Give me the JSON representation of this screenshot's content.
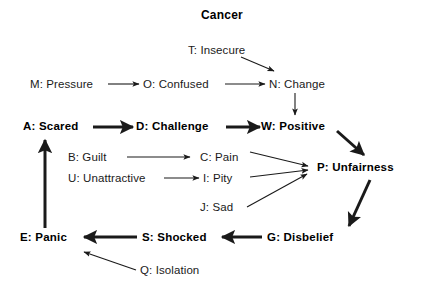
{
  "diagram": {
    "title": "Cancer",
    "title_x": 201,
    "title_y": 8,
    "width": 423,
    "height": 298,
    "stroke_color": "#1a1a1a",
    "text_color": "#1a1a1a",
    "background_color": "#ffffff"
  },
  "nodes": [
    {
      "id": "T",
      "label": "T: Insecure",
      "x": 188,
      "y": 44,
      "bold": false
    },
    {
      "id": "M",
      "label": "M: Pressure",
      "x": 30,
      "y": 78,
      "bold": false
    },
    {
      "id": "O",
      "label": "O: Confused",
      "x": 143,
      "y": 78,
      "bold": false
    },
    {
      "id": "N",
      "label": "N: Change",
      "x": 269,
      "y": 78,
      "bold": false
    },
    {
      "id": "A",
      "label": "A: Scared",
      "x": 23,
      "y": 120,
      "bold": true
    },
    {
      "id": "D",
      "label": "D: Challenge",
      "x": 136,
      "y": 120,
      "bold": true
    },
    {
      "id": "W",
      "label": "W: Positive",
      "x": 261,
      "y": 120,
      "bold": true
    },
    {
      "id": "B",
      "label": "B: Guilt",
      "x": 68,
      "y": 151,
      "bold": false
    },
    {
      "id": "C",
      "label": "C: Pain",
      "x": 200,
      "y": 151,
      "bold": false
    },
    {
      "id": "P",
      "label": "P: Unfairness",
      "x": 317,
      "y": 161,
      "bold": true
    },
    {
      "id": "U",
      "label": "U: Unattractive",
      "x": 68,
      "y": 172,
      "bold": false
    },
    {
      "id": "I",
      "label": "I: Pity",
      "x": 203,
      "y": 172,
      "bold": false
    },
    {
      "id": "J",
      "label": "J: Sad",
      "x": 200,
      "y": 201,
      "bold": false
    },
    {
      "id": "E",
      "label": "E: Panic",
      "x": 20,
      "y": 231,
      "bold": true
    },
    {
      "id": "S",
      "label": "S: Shocked",
      "x": 142,
      "y": 231,
      "bold": true
    },
    {
      "id": "G",
      "label": "G: Disbelief",
      "x": 267,
      "y": 231,
      "bold": true
    },
    {
      "id": "Q",
      "label": "Q: Isolation",
      "x": 140,
      "y": 264,
      "bold": false
    }
  ],
  "edges": [
    {
      "id": "M-O",
      "from": "M",
      "to": "O",
      "weight": "thin",
      "x1": 108,
      "y1": 84,
      "x2": 139,
      "y2": 84
    },
    {
      "id": "O-N",
      "from": "O",
      "to": "N",
      "weight": "thin",
      "x1": 225,
      "y1": 84,
      "x2": 265,
      "y2": 84
    },
    {
      "id": "T-N",
      "from": "T",
      "to": "N",
      "weight": "thin",
      "x1": 241,
      "y1": 57,
      "x2": 274,
      "y2": 71
    },
    {
      "id": "N-W",
      "from": "N",
      "to": "W",
      "weight": "thin",
      "x1": 295,
      "y1": 93,
      "x2": 295,
      "y2": 115
    },
    {
      "id": "A-D",
      "from": "A",
      "to": "D",
      "weight": "thick",
      "x1": 93,
      "y1": 127,
      "x2": 133,
      "y2": 127
    },
    {
      "id": "D-W",
      "from": "D",
      "to": "W",
      "weight": "thick",
      "x1": 226,
      "y1": 127,
      "x2": 260,
      "y2": 127
    },
    {
      "id": "W-P",
      "from": "W",
      "to": "P",
      "weight": "thick",
      "x1": 337,
      "y1": 131,
      "x2": 364,
      "y2": 155
    },
    {
      "id": "B-C",
      "from": "B",
      "to": "C",
      "weight": "thin",
      "x1": 127,
      "y1": 157,
      "x2": 190,
      "y2": 157
    },
    {
      "id": "U-I",
      "from": "U",
      "to": "I",
      "weight": "thin",
      "x1": 164,
      "y1": 178,
      "x2": 199,
      "y2": 178
    },
    {
      "id": "C-P",
      "from": "C",
      "to": "P",
      "weight": "thin",
      "x1": 250,
      "y1": 152,
      "x2": 308,
      "y2": 166
    },
    {
      "id": "I-P",
      "from": "I",
      "to": "P",
      "weight": "thin",
      "x1": 250,
      "y1": 177,
      "x2": 308,
      "y2": 170
    },
    {
      "id": "J-P",
      "from": "J",
      "to": "P",
      "weight": "thin",
      "x1": 247,
      "y1": 207,
      "x2": 307,
      "y2": 174
    },
    {
      "id": "P-G",
      "from": "P",
      "to": "G",
      "weight": "thick",
      "x1": 370,
      "y1": 180,
      "x2": 349,
      "y2": 226
    },
    {
      "id": "G-S",
      "from": "G",
      "to": "S",
      "weight": "thick",
      "x1": 262,
      "y1": 237,
      "x2": 222,
      "y2": 237
    },
    {
      "id": "S-E",
      "from": "S",
      "to": "E",
      "weight": "thick",
      "x1": 137,
      "y1": 237,
      "x2": 84,
      "y2": 237
    },
    {
      "id": "E-A",
      "from": "E",
      "to": "A",
      "weight": "thick",
      "x1": 45,
      "y1": 228,
      "x2": 45,
      "y2": 140
    },
    {
      "id": "Q-E",
      "from": "Q",
      "to": "E",
      "weight": "thin",
      "x1": 136,
      "y1": 270,
      "x2": 84,
      "y2": 252
    }
  ]
}
